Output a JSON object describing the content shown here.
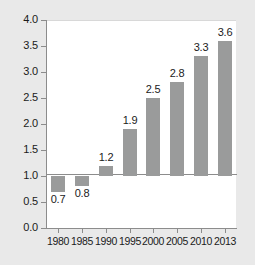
{
  "chart_data": {
    "type": "bar",
    "title": "",
    "subtitle": "",
    "xlabel": "",
    "ylabel": "",
    "categories": [
      "1980",
      "1985",
      "1990",
      "1995",
      "2000",
      "2005",
      "2010",
      "2013"
    ],
    "values": [
      0.7,
      0.8,
      1.2,
      1.9,
      2.5,
      2.8,
      3.3,
      3.6
    ],
    "data_labels": [
      "0.7",
      "0.8",
      "1.2",
      "1.9",
      "2.5",
      "2.8",
      "3.3",
      "3.6"
    ],
    "baseline": 1.0,
    "ylim": [
      0.0,
      4.0
    ],
    "ytick_values": [
      0.0,
      0.5,
      1.0,
      1.5,
      2.0,
      2.5,
      3.0,
      3.5,
      4.0
    ],
    "ytick_labels": [
      "0.0",
      "0.5",
      "1.0",
      "1.5",
      "2.0",
      "2.5",
      "3.0",
      "3.5",
      "4.0"
    ],
    "grid": false,
    "legend": false,
    "legend_position": "none",
    "bar_color": "#9a9b9b",
    "plot_background": "#ffffff",
    "figure_background": "#e9e9e9",
    "axis_color": "#8c8c8c",
    "text_color": "#1b1b1b"
  }
}
